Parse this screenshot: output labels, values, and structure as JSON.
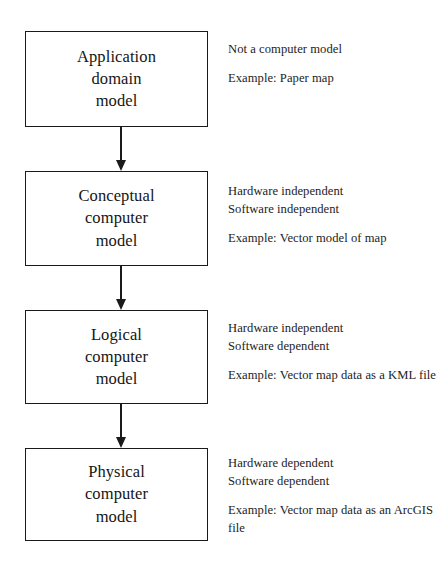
{
  "diagram": {
    "orientation": "vertical-top-down",
    "arrow_style": "solid-line-filled-triangle-head",
    "colors": {
      "background": "#ffffff",
      "stroke": "#1a1a1a",
      "text": "#1a1a1a"
    },
    "nodes": [
      {
        "id": "application-domain-model",
        "label": "Application\ndomain\nmodel",
        "annotation": {
          "properties": "Not a computer model",
          "example": "Example: Paper map"
        }
      },
      {
        "id": "conceptual-computer-model",
        "label": "Conceptual\ncomputer\nmodel",
        "annotation": {
          "properties": "Hardware independent\nSoftware independent",
          "example": "Example: Vector model of map"
        }
      },
      {
        "id": "logical-computer-model",
        "label": "Logical\ncomputer\nmodel",
        "annotation": {
          "properties": "Hardware independent\nSoftware dependent",
          "example": "Example: Vector map data as a KML file"
        }
      },
      {
        "id": "physical-computer-model",
        "label": "Physical\ncomputer\nmodel",
        "annotation": {
          "properties": "Hardware dependent\nSoftware dependent",
          "example": "Example: Vector map data as an ArcGIS file"
        }
      }
    ],
    "edges": [
      {
        "from": "application-domain-model",
        "to": "conceptual-computer-model"
      },
      {
        "from": "conceptual-computer-model",
        "to": "logical-computer-model"
      },
      {
        "from": "logical-computer-model",
        "to": "physical-computer-model"
      }
    ]
  }
}
